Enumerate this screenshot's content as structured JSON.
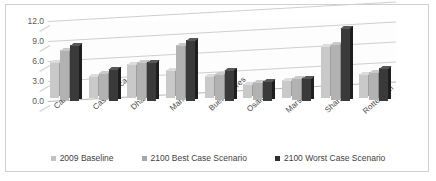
{
  "chart_data": {
    "type": "bar",
    "title": "",
    "subtitle": "",
    "xlabel": "",
    "ylabel": "",
    "ylim": [
      0.0,
      12.0
    ],
    "yticks": [
      "0.0",
      "3.0",
      "6.0",
      "9.0",
      "12.0"
    ],
    "ytick_values": [
      0.0,
      3.0,
      6.0,
      9.0,
      12.0
    ],
    "grid": true,
    "legend_position": "bottom",
    "three_d": true,
    "categories": [
      "Calcutta",
      "Casablanca",
      "Dhaka",
      "Manila",
      "BuenosAires",
      "Osaka",
      "Marseille",
      "Shanghai",
      "Rotterdam"
    ],
    "series": [
      {
        "name": "2009 Baseline",
        "color": "#c9c9c9",
        "values": [
          5.5,
          3.3,
          5.2,
          4.3,
          3.4,
          2.2,
          2.8,
          7.9,
          3.6
        ]
      },
      {
        "name": "2100 Best Case Scenario",
        "color": "#b2b2b2",
        "values": [
          7.4,
          4.0,
          5.6,
          8.2,
          3.8,
          2.6,
          3.2,
          8.4,
          4.2
        ]
      },
      {
        "name": "2100 Worst Case Scenario",
        "color": "#3a3a3a",
        "values": [
          8.4,
          4.8,
          5.8,
          9.2,
          4.6,
          3.0,
          3.5,
          10.9,
          4.9
        ]
      }
    ]
  },
  "legend": {
    "items": [
      {
        "label": "2009 Baseline"
      },
      {
        "label": "2100 Best Case Scenario"
      },
      {
        "label": "2100 Worst Case Scenario"
      }
    ]
  }
}
